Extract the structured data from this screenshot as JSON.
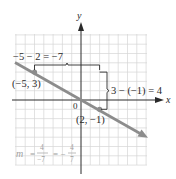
{
  "figure": {
    "axes": {
      "x_label": "x",
      "y_label": "y",
      "origin_label": "0"
    },
    "points": [
      {
        "label": "(−5, 3)",
        "x": -5,
        "y": 3
      },
      {
        "label": "(2, −1)",
        "x": 2,
        "y": -1
      }
    ],
    "annotations": {
      "run": "−5 − 2 = −7",
      "rise": "3 − (−1) = 4",
      "slope_m": "m",
      "slope_eq1": "=",
      "slope_num1": "4",
      "slope_den1": "−7",
      "slope_eq2": "= −",
      "slope_num2": "4",
      "slope_den2": "7"
    },
    "colors": {
      "line": "#8c8c8c",
      "grid": "#d4d4d4",
      "axis": "#2a2a2a",
      "bracket": "#2a2a2a"
    },
    "grid_range": {
      "x": [
        -7,
        7
      ],
      "y": [
        -7,
        7
      ]
    }
  }
}
